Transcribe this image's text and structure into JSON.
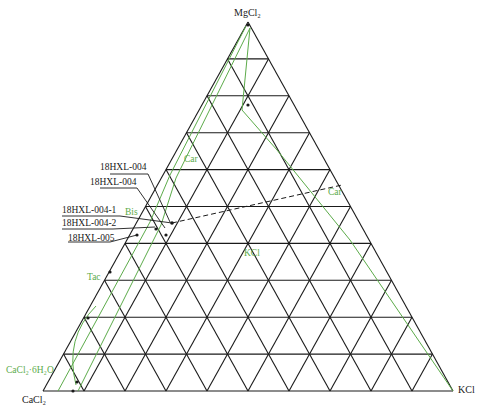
{
  "diagram": {
    "type": "ternary-phase-diagram",
    "vertices": {
      "top": "MgCl₂",
      "left": "CaCl₂",
      "right": "KCl"
    },
    "grid_divisions": 10,
    "colors": {
      "grid": "#1a1a1a",
      "phase_boundary": "#5cab4a",
      "phase_label": "#5cab4a",
      "sample_label": "#1a1a1a"
    },
    "phase_labels": [
      {
        "id": "car-upper",
        "text": "Car"
      },
      {
        "id": "car-right",
        "text": "Car"
      },
      {
        "id": "bis",
        "text": "Bis"
      },
      {
        "id": "kcl-region",
        "text": "KCl"
      },
      {
        "id": "tac",
        "text": "Tac"
      },
      {
        "id": "cacl2-6h2o",
        "text": "CaCl₂·6H₂O"
      }
    ],
    "sample_labels": [
      {
        "id": "s1",
        "text": "18HXL-004"
      },
      {
        "id": "s2",
        "text": "18HXL-004"
      },
      {
        "id": "s3",
        "text": "18HXL-004-1"
      },
      {
        "id": "s4",
        "text": "18HXL-004-2"
      },
      {
        "id": "s5",
        "text": "18HXL-005"
      }
    ]
  }
}
